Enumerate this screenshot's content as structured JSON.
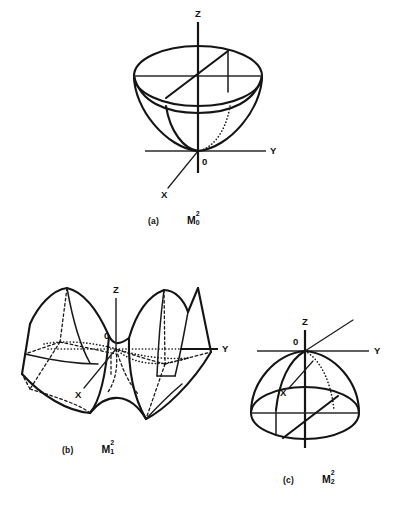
{
  "page": {
    "background_color": "#ffffff",
    "ink_color": "#141414",
    "width": 403,
    "height": 516
  },
  "figures": [
    {
      "id": "fig-a",
      "tag": "(a)",
      "symbol": {
        "base": "M",
        "superscript": "2",
        "subscript": "0"
      },
      "surface": "elliptic-paraboloid-opening-upward",
      "description": "Upward opening paraboloid (bowl) with elliptical rim at top, vertex at origin",
      "axes": [
        {
          "name": "Z",
          "label": "Z",
          "direction": "up",
          "style": "solid"
        },
        {
          "name": "Y",
          "label": "Y",
          "direction": "right",
          "style": "solid"
        },
        {
          "name": "X",
          "label": "X",
          "direction": "lower-left",
          "style": "solid-with-leader"
        }
      ],
      "origin_label": "0"
    },
    {
      "id": "fig-b",
      "tag": "(b)",
      "symbol": {
        "base": "M",
        "superscript": "2",
        "subscript": "1"
      },
      "surface": "hyperbolic-paraboloid-saddle",
      "description": "Saddle surface (hyperbolic paraboloid) with two upswept wings, saddle point at origin",
      "axes": [
        {
          "name": "Z",
          "label": "Z",
          "direction": "up",
          "style": "solid"
        },
        {
          "name": "Y",
          "label": "Y",
          "direction": "right",
          "style": "solid"
        },
        {
          "name": "X",
          "label": "X",
          "direction": "lower-left",
          "style": "solid-with-leader"
        }
      ],
      "origin_label": "0"
    },
    {
      "id": "fig-c",
      "tag": "(c)",
      "symbol": {
        "base": "M",
        "superscript": "2",
        "subscript": "2"
      },
      "surface": "elliptic-paraboloid-opening-downward",
      "description": "Downward opening paraboloid (dome) with elliptical rim at bottom, vertex at origin",
      "axes": [
        {
          "name": "Z",
          "label": "Z",
          "direction": "up",
          "style": "solid"
        },
        {
          "name": "Y",
          "label": "Y",
          "direction": "right",
          "style": "solid"
        },
        {
          "name": "X",
          "label": "X",
          "direction": "upper-right",
          "style": "solid-with-leader"
        }
      ],
      "origin_label": "0"
    }
  ]
}
